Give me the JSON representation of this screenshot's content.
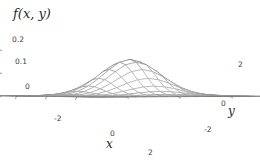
{
  "figure": {
    "kind": "surface-plot-3d",
    "background": "#ffffff",
    "mesh_color": "#8a8a8a",
    "shade_dark": "#4a4a4a",
    "axis_color": "#6e6e6e",
    "text_color": "#2b2b2b",
    "width": 260,
    "height": 168
  },
  "labels": {
    "z": "f(x, y)",
    "x": "x",
    "y": "y"
  },
  "ticks": {
    "z": [
      {
        "value": "0.2",
        "left": 12,
        "top": 35
      },
      {
        "value": "0.1",
        "left": 15,
        "top": 57
      },
      {
        "value": "0",
        "left": 25,
        "top": 82
      }
    ],
    "x": [
      {
        "value": "-2",
        "left": 54,
        "top": 114
      },
      {
        "value": "0",
        "left": 110,
        "top": 129
      },
      {
        "value": "2",
        "left": 148,
        "top": 148
      }
    ],
    "y": [
      {
        "value": "2",
        "left": 238,
        "top": 60
      },
      {
        "value": "0",
        "left": 221,
        "top": 99
      },
      {
        "value": "-2",
        "left": 204,
        "top": 125
      }
    ]
  },
  "chart_data": {
    "type": "surface",
    "title": "",
    "xlabel": "x",
    "ylabel": "y",
    "zlabel": "f(x, y)",
    "xlim": [
      -3.2,
      3.2
    ],
    "ylim": [
      -3.2,
      3.2
    ],
    "zlim": [
      0,
      0.22
    ],
    "xticks": [
      -2,
      0,
      2
    ],
    "yticks": [
      -2,
      0,
      2
    ],
    "zticks": [
      0,
      0.1,
      0.2
    ],
    "grid": true,
    "legend": null,
    "mesh_divisions_x": 16,
    "mesh_divisions_y": 16,
    "function": "bivariate gaussian: f(x,y) = (1/(2*pi)) * exp(-(x^2 + y^2)/2)",
    "peak": {
      "x": 0,
      "y": 0,
      "z": 0.159
    },
    "z_samples": {
      "x": [
        -3,
        -2,
        -1,
        0,
        1,
        2,
        3
      ],
      "y": [
        -3,
        -2,
        -1,
        0,
        1,
        2,
        3
      ],
      "z": [
        [
          0.0002,
          0.0015,
          0.0044,
          0.0018,
          0.0044,
          0.0015,
          0.0002
        ],
        [
          0.0015,
          0.0108,
          0.0293,
          0.0215,
          0.0293,
          0.0108,
          0.0015
        ],
        [
          0.0044,
          0.0293,
          0.0965,
          0.0965,
          0.0965,
          0.0293,
          0.0044
        ],
        [
          0.0018,
          0.0215,
          0.0965,
          0.1592,
          0.0965,
          0.0215,
          0.0018
        ],
        [
          0.0044,
          0.0293,
          0.0965,
          0.0965,
          0.0965,
          0.0293,
          0.0044
        ],
        [
          0.0015,
          0.0108,
          0.0293,
          0.0215,
          0.0293,
          0.0108,
          0.0015
        ],
        [
          0.0002,
          0.0015,
          0.0044,
          0.0018,
          0.0044,
          0.0015,
          0.0002
        ]
      ]
    }
  },
  "projection": {
    "azimuth_deg": -60,
    "elevation_deg": 22,
    "origin_px": {
      "x": 130,
      "y": 96
    },
    "scale_x": 30,
    "scale_y": 30,
    "scale_z": 230
  }
}
